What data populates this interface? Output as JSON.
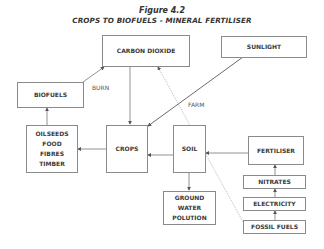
{
  "figure": {
    "number": "Figure 4.2",
    "title": "CROPS TO BIOFUELS - MINERAL FERTILISER"
  },
  "nodes": {
    "carbon_dioxide": "CARBON DIOXIDE",
    "sunlight": "SUNLIGHT",
    "biofuels": "BIOFUELS",
    "oilseeds": [
      "OILSEEDS",
      "FOOD",
      "FIBRES",
      "TIMBER"
    ],
    "crops": "CROPS",
    "soil": "SOIL",
    "fertiliser": "FERTILISER",
    "nitrates": "NITRATES",
    "electricity": "ELECTRICITY",
    "fossil_fuels": "FOSSIL FUELS",
    "ground_water": [
      "GROUND",
      "WATER",
      "POLUTION"
    ]
  },
  "edge_labels": {
    "burn": "BURN",
    "farm": "FARM"
  },
  "edges": [
    {
      "from": "biofuels",
      "to": "carbon_dioxide",
      "label": "BURN"
    },
    {
      "from": "carbon_dioxide",
      "to": "crops"
    },
    {
      "from": "sunlight",
      "to": "crops"
    },
    {
      "from": "oilseeds",
      "to": "biofuels"
    },
    {
      "from": "crops",
      "to": "oilseeds"
    },
    {
      "from": "soil",
      "to": "crops"
    },
    {
      "from": "fertiliser",
      "to": "soil"
    },
    {
      "from": "soil",
      "to": "ground_water"
    },
    {
      "from": "nitrates",
      "to": "fertiliser"
    },
    {
      "from": "electricity",
      "to": "nitrates"
    },
    {
      "from": "fossil_fuels",
      "to": "electricity"
    },
    {
      "from": "fossil_fuels",
      "to": "carbon_dioxide",
      "style": "dotted",
      "label": "FARM"
    }
  ]
}
